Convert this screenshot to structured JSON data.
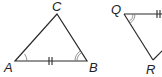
{
  "diagram": {
    "type": "congruent-triangles",
    "triangles": [
      {
        "name": "ABC",
        "vertices": {
          "A": {
            "label": "A",
            "x": 15,
            "y": 61
          },
          "B": {
            "label": "B",
            "x": 87,
            "y": 61
          },
          "C": {
            "label": "C",
            "x": 57,
            "y": 14
          }
        },
        "marks": {
          "side_AB": "double-tick",
          "angle_A": "single-arc",
          "angle_B": "double-arc"
        }
      },
      {
        "name": "QR-partial",
        "vertices": {
          "Q": {
            "label": "Q",
            "x": 124,
            "y": 14
          },
          "R": {
            "label": "R",
            "x": 153,
            "y": 60
          }
        },
        "marks": {
          "side_Q_right": "double-tick",
          "angle_Q": "double-arc"
        }
      }
    ],
    "colors": {
      "line": "#2a2a2a",
      "arc": "#777777",
      "background": "#ffffff"
    }
  }
}
